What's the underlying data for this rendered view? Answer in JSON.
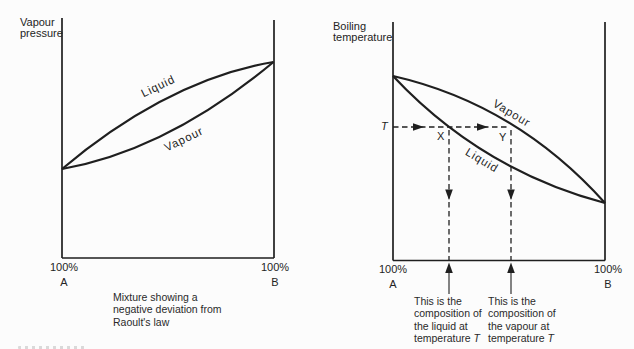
{
  "figure": {
    "left_diagram": {
      "axis_label_line1": "Vapour",
      "axis_label_line2": "pressure",
      "liquid_curve_label": "Liquid",
      "vapour_curve_label": "Vapour",
      "x_axis_left_percent": "100%",
      "x_axis_left_component": "A",
      "x_axis_right_percent": "100%",
      "x_axis_right_component": "B",
      "caption_line1": "Mixture showing a",
      "caption_line2": "negative deviation from",
      "caption_line3": "Raoult's law"
    },
    "right_diagram": {
      "axis_label_line1": "Boiling",
      "axis_label_line2": "temperature",
      "liquid_curve_label": "Liquid",
      "vapour_curve_label": "Vapour",
      "temperature_label": "T",
      "point_x_label": "X",
      "point_y_label": "Y",
      "x_axis_left_percent": "100%",
      "x_axis_left_component": "A",
      "x_axis_right_percent": "100%",
      "x_axis_right_component": "B",
      "caption_liquid_line1": "This is the",
      "caption_liquid_line2": "composition of",
      "caption_liquid_line3": "the liquid at",
      "caption_liquid_line4_prefix": "temperature ",
      "caption_liquid_line4_symbol": "T",
      "caption_vapour_line1": "This is the",
      "caption_vapour_line2": "composition of",
      "caption_vapour_line3": "the vapour at",
      "caption_vapour_line4_prefix": "temperature ",
      "caption_vapour_line4_symbol": "T"
    },
    "colors": {
      "line": "#1f1f1f",
      "text": "#242424",
      "background": "#fcfcfc"
    }
  }
}
